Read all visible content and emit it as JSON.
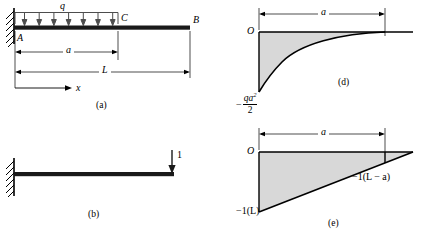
{
  "figure": {
    "panels": [
      {
        "id": "a",
        "caption": "(a)",
        "description": "Cantilever beam AB fixed at A with uniform distributed load q over segment AC of length a; total length L; x axis to the right.",
        "labels": {
          "load": "q",
          "point_a": "A",
          "point_b": "B",
          "point_c": "C",
          "dim_a": "a",
          "dim_L": "L",
          "axis_x": "x"
        },
        "load_arrow_count": 7
      },
      {
        "id": "b",
        "caption": "(b)",
        "description": "Cantilever beam fixed at left with unit downward load at the free right end.",
        "labels": {
          "unit_load": "1"
        }
      },
      {
        "id": "d",
        "caption": "(d)",
        "description": "Bending moment diagram for the distributed load: parabolic curve from minus q a squared over two at the support rising to zero at distance a, then zero to the end.",
        "labels": {
          "origin": "O",
          "dim_a": "a",
          "min_value_minus": "−",
          "min_value_numerator": "qa",
          "min_value_exponent": "2",
          "min_value_denominator": "2"
        }
      },
      {
        "id": "e",
        "caption": "(e)",
        "description": "Bending moment diagram for the unit load: linear from minus 1 times L at the support to zero at the free end, with value minus 1 times L minus a at distance a.",
        "labels": {
          "origin": "O",
          "dim_a": "a",
          "value_at_support": "−1(L)",
          "value_at_a": "−1(L − a)"
        }
      }
    ]
  },
  "style": {
    "line_color": "#000000",
    "beam_color": "#1a1a1a",
    "shade_color": "#d8d8d8",
    "background": "#ffffff"
  }
}
